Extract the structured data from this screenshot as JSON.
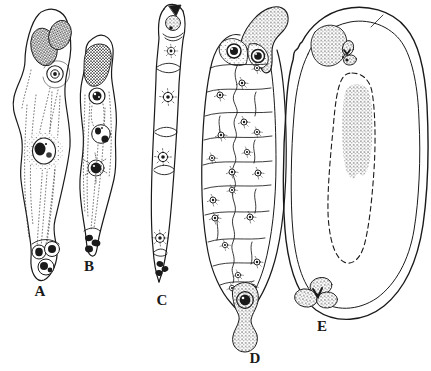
{
  "figure": {
    "panels": [
      {
        "label": "A"
      },
      {
        "label": "B"
      },
      {
        "label": "C"
      },
      {
        "label": "D"
      },
      {
        "label": "E"
      }
    ]
  },
  "colors": {
    "ink": "#1a1a1a",
    "paper": "#ffffff"
  }
}
